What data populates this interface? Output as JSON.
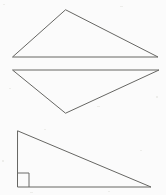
{
  "document": {
    "title": "Geometry figure sheet",
    "kind": "line-drawing",
    "background_color": "#fbfbfb",
    "stroke_color": "#666663",
    "canvas": {
      "width": 166,
      "height": 195
    }
  },
  "figures": [
    {
      "id": "triangle-top",
      "name": "obtuse-triangle-pointing-up",
      "label": "Triangle 1",
      "points": "66,10 158,57 13,57",
      "vertices": [
        {
          "name": "apex",
          "x": 66,
          "y": 10
        },
        {
          "name": "bottom-right",
          "x": 158,
          "y": 57
        },
        {
          "name": "bottom-left",
          "x": 13,
          "y": 57
        }
      ],
      "right_angle": false
    },
    {
      "id": "triangle-middle",
      "name": "obtuse-triangle-pointing-down",
      "label": "Triangle 2",
      "points": "13,70 159,70 66,113",
      "vertices": [
        {
          "name": "top-left",
          "x": 13,
          "y": 70
        },
        {
          "name": "top-right",
          "x": 159,
          "y": 70
        },
        {
          "name": "bottom-apex",
          "x": 66,
          "y": 113
        }
      ],
      "right_angle": false
    },
    {
      "id": "triangle-bottom",
      "name": "right-triangle",
      "label": "Triangle 3",
      "points": "18,131 151,187 18,187",
      "vertices": [
        {
          "name": "top-left",
          "x": 18,
          "y": 131
        },
        {
          "name": "bottom-right",
          "x": 151,
          "y": 187
        },
        {
          "name": "bottom-left",
          "x": 18,
          "y": 187
        }
      ],
      "right_angle": true,
      "right_angle_marker": {
        "name": "right-angle-square",
        "path": "M 29,187 L 29,173 L 18,173",
        "corner": {
          "x": 18,
          "y": 187
        },
        "size": 11
      }
    }
  ],
  "specks": [
    {
      "x": 3,
      "y": 4,
      "w": 2,
      "h": 1
    },
    {
      "x": 120,
      "y": 6,
      "w": 3,
      "h": 1
    },
    {
      "x": 9,
      "y": 88,
      "w": 2,
      "h": 1
    },
    {
      "x": 156,
      "y": 96,
      "w": 2,
      "h": 2
    },
    {
      "x": 97,
      "y": 106,
      "w": 3,
      "h": 1
    },
    {
      "x": 44,
      "y": 129,
      "w": 2,
      "h": 1
    },
    {
      "x": 140,
      "y": 150,
      "w": 2,
      "h": 1
    },
    {
      "x": 30,
      "y": 192,
      "w": 3,
      "h": 1
    },
    {
      "x": 108,
      "y": 191,
      "w": 2,
      "h": 1
    },
    {
      "x": 2,
      "y": 160,
      "w": 2,
      "h": 2
    }
  ]
}
